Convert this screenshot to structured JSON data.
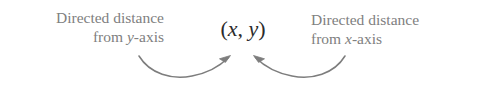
{
  "figure": {
    "background_color": "#ffffff",
    "width": 485,
    "height": 92,
    "label_color": "#808080",
    "point_color": "#2b2b2b",
    "arrow_color": "#7d7d7d"
  },
  "left_label": {
    "line1": "Directed distance",
    "line2_prefix": "from ",
    "line2_variable": "y",
    "line2_suffix": "-axis",
    "full_text": "Directed distance from y-axis"
  },
  "right_label": {
    "line1": "Directed distance",
    "line2_prefix": "from ",
    "line2_variable": "x",
    "line2_suffix": "-axis",
    "full_text": "Directed distance from x-axis"
  },
  "point": {
    "open_paren": "(",
    "x_variable": "x",
    "separator": ", ",
    "y_variable": "y",
    "close_paren": ")",
    "full_text": "(x, y)"
  },
  "arrows": [
    {
      "name": "left-arrow",
      "from": "from y-axis label",
      "to": "point",
      "direction": "curves right and up"
    },
    {
      "name": "right-arrow",
      "from": "from x-axis label",
      "to": "point",
      "direction": "curves left and up"
    }
  ]
}
